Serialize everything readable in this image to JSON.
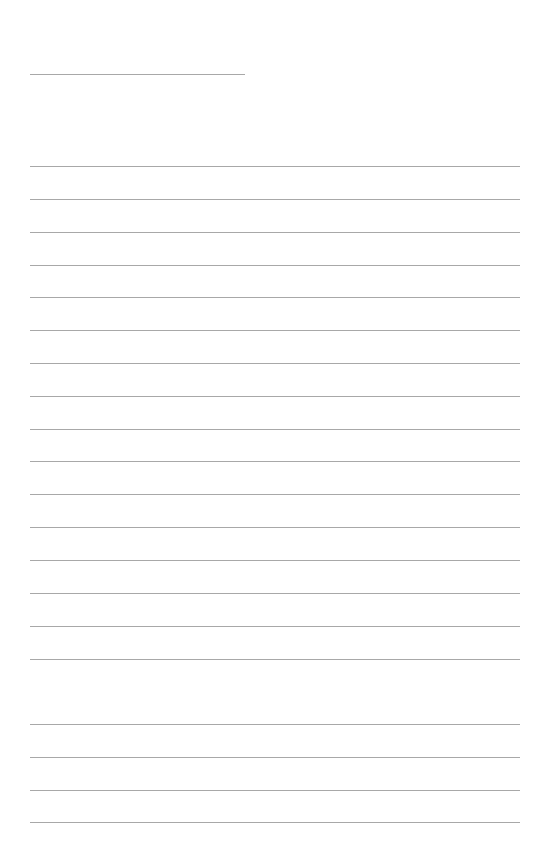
{
  "page": {
    "type": "ruled-form",
    "background": "#ffffff",
    "line_color": "#a8a8a8",
    "header_line": {
      "y": 74,
      "x": 30,
      "width": 215
    },
    "ruled_lines_y": [
      166,
      199,
      232,
      265,
      297,
      330,
      363,
      396,
      429,
      461,
      494,
      527,
      560,
      593,
      626,
      659,
      724,
      757,
      790,
      822
    ]
  }
}
